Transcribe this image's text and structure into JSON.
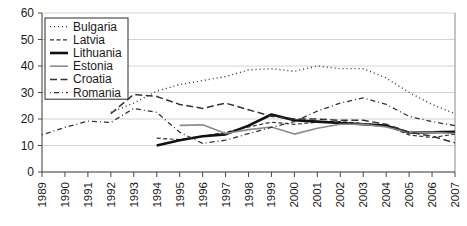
{
  "chart_data": {
    "type": "line",
    "title": "",
    "subtitle": "",
    "xlabel": "",
    "ylabel": "",
    "xlim": [
      1989,
      2007
    ],
    "ylim": [
      0,
      60
    ],
    "ytick_step": 10,
    "grid": true,
    "legend_position": "top-left",
    "x": [
      1989,
      1990,
      1991,
      1992,
      1993,
      1994,
      1995,
      1996,
      1997,
      1998,
      1999,
      2000,
      2001,
      2002,
      2003,
      2004,
      2005,
      2006,
      2007
    ],
    "xtick_labels": [
      "1989",
      "1990",
      "1991",
      "1992",
      "1993",
      "1994",
      "1995",
      "1996",
      "1997",
      "1998",
      "1999",
      "2000",
      "2001",
      "2002",
      "2003",
      "2004",
      "2005",
      "2006",
      "2007"
    ],
    "ytick_labels": [
      "0",
      "10",
      "20",
      "30",
      "40",
      "50",
      "60"
    ],
    "ytick_values": [
      0,
      10,
      20,
      30,
      40,
      50,
      60
    ],
    "series": [
      {
        "name": "Bulgaria",
        "style": "dotted",
        "color": "#333333",
        "width": 1.4,
        "dash": "1,3",
        "x": [
          1992,
          1993,
          1994,
          1995,
          1996,
          1997,
          1998,
          1999,
          2000,
          2001,
          2002,
          2003,
          2004,
          2005,
          2006,
          2007
        ],
        "values": [
          22.5,
          26.0,
          30.5,
          33.0,
          34.5,
          36.0,
          38.5,
          39.0,
          38.0,
          40.0,
          39.0,
          39.0,
          35.5,
          30.0,
          25.5,
          22.0
        ]
      },
      {
        "name": "Latvia",
        "style": "fine-dashed",
        "color": "#333333",
        "width": 1.2,
        "dash": "4,2.5",
        "x": [
          1994,
          1995,
          1996,
          1997,
          1998,
          1999,
          2000,
          2001,
          2002,
          2003,
          2004,
          2005,
          2006,
          2007
        ],
        "values": [
          12.8,
          12.2,
          13.5,
          15.0,
          17.0,
          18.8,
          18.0,
          18.8,
          19.0,
          18.3,
          17.5,
          14.0,
          13.0,
          14.3
        ]
      },
      {
        "name": "Lithuania",
        "style": "solid-thick",
        "color": "#111111",
        "width": 2.6,
        "dash": "none",
        "x": [
          1994,
          1995,
          1996,
          1997,
          1998,
          1999,
          2000,
          2001,
          2002,
          2003,
          2004,
          2005,
          2006,
          2007
        ],
        "values": [
          10.0,
          12.0,
          13.5,
          14.2,
          17.5,
          21.7,
          19.5,
          19.0,
          18.5,
          18.0,
          17.5,
          14.8,
          15.0,
          15.2
        ]
      },
      {
        "name": "Estonia",
        "style": "solid-thin-gray",
        "color": "#8c8c8c",
        "width": 1.6,
        "dash": "none",
        "x": [
          1995,
          1996,
          1997,
          1998,
          1999,
          2000,
          2001,
          2002,
          2003,
          2004,
          2005,
          2006,
          2007
        ],
        "values": [
          17.6,
          17.8,
          14.5,
          16.0,
          17.0,
          14.3,
          16.5,
          18.0,
          18.0,
          17.0,
          14.8,
          15.0,
          14.5
        ]
      },
      {
        "name": "Croatia",
        "style": "long-dashed",
        "color": "#333333",
        "width": 1.5,
        "dash": "7,3.5",
        "x": [
          1992,
          1993,
          1994,
          1995,
          1996,
          1997,
          1998,
          1999,
          2000,
          2001,
          2002,
          2003,
          2004,
          2005,
          2006,
          2007
        ],
        "values": [
          22.0,
          29.3,
          28.5,
          25.5,
          24.0,
          26.0,
          23.5,
          21.0,
          20.0,
          20.0,
          19.5,
          19.5,
          18.0,
          15.0,
          13.5,
          11.0
        ]
      },
      {
        "name": "Romania",
        "style": "dash-dot",
        "color": "#333333",
        "width": 1.3,
        "dash": "1,3,5,3",
        "x": [
          1989,
          1990,
          1991,
          1992,
          1993,
          1994,
          1995,
          1996,
          1997,
          1998,
          1999,
          2000,
          2001,
          2002,
          2003,
          2004,
          2005,
          2006,
          2007
        ],
        "values": [
          14.0,
          16.8,
          19.2,
          18.7,
          24.0,
          22.5,
          15.0,
          10.8,
          12.0,
          14.5,
          16.8,
          19.0,
          23.0,
          26.0,
          28.0,
          25.5,
          21.0,
          19.0,
          17.5
        ]
      }
    ]
  },
  "legend": {
    "entries": [
      {
        "label": "Bulgaria"
      },
      {
        "label": "Latvia"
      },
      {
        "label": "Lithuania"
      },
      {
        "label": "Estonia"
      },
      {
        "label": "Croatia"
      },
      {
        "label": "Romania"
      }
    ]
  }
}
